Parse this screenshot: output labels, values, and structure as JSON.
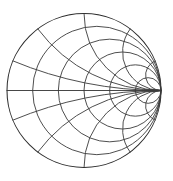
{
  "figure": {
    "kind": "smith-chart",
    "title": "",
    "background_color": "#ffffff",
    "line_color": "#3a3a3a",
    "outer_line_color": "#2e2e2e",
    "width": 173,
    "height": 181
  },
  "chart_data": {
    "type": "line",
    "chart_kind": "smith-chart",
    "title": "",
    "subtitle": "",
    "xlabel": "",
    "ylabel": "",
    "grid": true,
    "legend": null,
    "legend_position": "none",
    "annotations": [],
    "tick_labels": [],
    "geometry": {
      "center_x": 84,
      "center_y": 90.5,
      "radius": 77,
      "short_circuit_point": [
        7,
        90.5
      ],
      "open_circuit_point": [
        161,
        90.5
      ],
      "matched_center_point": [
        84,
        90.5
      ]
    },
    "axis_ranges": {
      "normalized_resistance": [
        0,
        "inf"
      ],
      "normalized_reactance": [
        "-inf",
        "inf"
      ],
      "reflection_coefficient_magnitude": [
        0,
        1
      ]
    },
    "resistance_circles": {
      "label": "constant normalized resistance r",
      "values": [
        0,
        0.2,
        0.5,
        1,
        2,
        5
      ],
      "x_axis_crossings_px": [
        7,
        51,
        84,
        115,
        135,
        149
      ]
    },
    "reactance_arcs": {
      "label": "constant normalized reactance x",
      "values": [
        -5,
        -2,
        -1,
        -0.5,
        -0.2,
        0,
        0.2,
        0.5,
        1,
        2,
        5
      ],
      "zero_arc_is_horizontal_axis": true
    },
    "series": [
      {
        "name": "constant resistance circles",
        "values": [
          0,
          0.2,
          0.5,
          1,
          2,
          5
        ]
      },
      {
        "name": "constant reactance arcs",
        "values": [
          -5,
          -2,
          -1,
          -0.5,
          -0.2,
          0.2,
          0.5,
          1,
          2,
          5
        ]
      }
    ]
  }
}
